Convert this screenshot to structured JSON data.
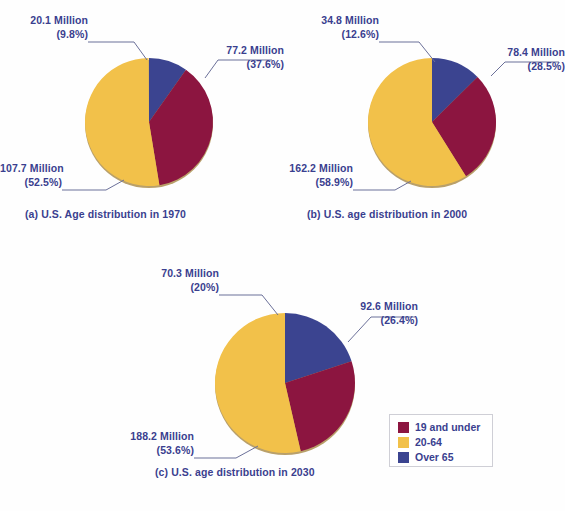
{
  "figure": {
    "background_color": "#fefefe",
    "text_color": "#3a3f8f"
  },
  "colors": {
    "under19": "#8c1540",
    "age20to64": "#f2c14a",
    "over65": "#3b4490",
    "leader_line": "#6b7099",
    "pie_edge": "#b9a06a"
  },
  "legend": {
    "position": "bottom-right",
    "items": [
      {
        "label": "19 and under",
        "color": "#8c1540",
        "swatch": "legend-swatch-under19"
      },
      {
        "label": "20-64",
        "color": "#f2c14a",
        "swatch": "legend-swatch-20to64"
      },
      {
        "label": "Over 65",
        "color": "#3b4490",
        "swatch": "legend-swatch-over65"
      }
    ]
  },
  "charts": [
    {
      "id": "chart-a",
      "caption": "(a) U.S. Age distribution in 1970",
      "year": "1970",
      "labels": {
        "over65_value": "20.1 Million",
        "over65_percent": "(9.8%)",
        "under19_value": "77.2 Million",
        "under19_percent": "(37.6%)",
        "age20to64_value": "107.7 Million",
        "age20to64_percent": "(52.5%)"
      }
    },
    {
      "id": "chart-b",
      "caption": "(b) U.S. age distribution in 2000",
      "year": "2000",
      "labels": {
        "over65_value": "34.8 Million",
        "over65_percent": "(12.6%)",
        "under19_value": "78.4 Million",
        "under19_percent": "(28.5%)",
        "age20to64_value": "162.2 Million",
        "age20to64_percent": "(58.9%)"
      }
    },
    {
      "id": "chart-c",
      "caption": "(c) U.S. age distribution in 2030",
      "year": "2030",
      "labels": {
        "over65_value": "70.3 Million",
        "over65_percent": "(20%)",
        "under19_value": "92.6 Million",
        "under19_percent": "(26.4%)",
        "age20to64_value": "188.2 Million",
        "age20to64_percent": "(53.6%)"
      }
    }
  ],
  "chart_data": [
    {
      "type": "pie",
      "title": "(a) U.S. Age distribution in 1970",
      "categories": [
        "19 and under",
        "20-64",
        "Over 65"
      ],
      "values": [
        77.2,
        107.7,
        20.1
      ],
      "percentages": [
        37.6,
        52.5,
        9.8
      ],
      "value_unit": "Million",
      "colors": [
        "#8c1540",
        "#f2c14a",
        "#3b4490"
      ],
      "legend_position": "bottom-right",
      "start_angle_deg": 0,
      "direction": "clockwise"
    },
    {
      "type": "pie",
      "title": "(b) U.S. age distribution in 2000",
      "categories": [
        "19 and under",
        "20-64",
        "Over 65"
      ],
      "values": [
        78.4,
        162.2,
        34.8
      ],
      "percentages": [
        28.5,
        58.9,
        12.6
      ],
      "value_unit": "Million",
      "colors": [
        "#8c1540",
        "#f2c14a",
        "#3b4490"
      ],
      "legend_position": "bottom-right",
      "start_angle_deg": 0,
      "direction": "clockwise"
    },
    {
      "type": "pie",
      "title": "(c) U.S. age distribution in 2030",
      "categories": [
        "19 and under",
        "20-64",
        "Over 65"
      ],
      "values": [
        92.6,
        188.2,
        70.3
      ],
      "percentages": [
        26.4,
        53.6,
        20.0
      ],
      "value_unit": "Million",
      "colors": [
        "#8c1540",
        "#f2c14a",
        "#3b4490"
      ],
      "legend_position": "bottom-right",
      "start_angle_deg": 0,
      "direction": "clockwise"
    }
  ]
}
